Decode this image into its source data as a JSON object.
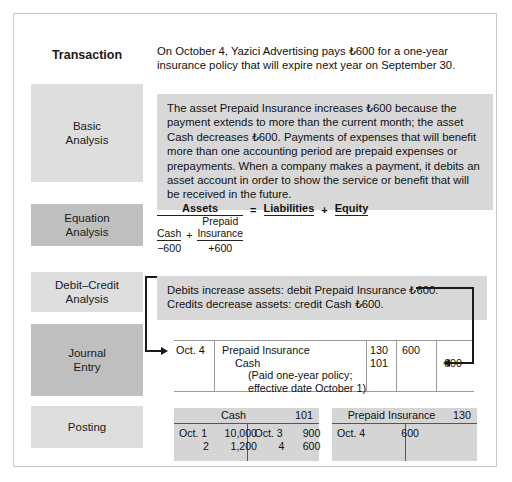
{
  "figure": {
    "currency_symbol": "₺",
    "border_color": "#c9c9c9",
    "shade_content": "#d8d8d8",
    "shade_label_dark": "#bfbfbf",
    "shade_label_light": "#dedede"
  },
  "stages": {
    "transaction": "Transaction",
    "basic_analysis": "Basic\nAnalysis",
    "basic_analysis_line1": "Basic",
    "basic_analysis_line2": "Analysis",
    "equation_analysis_line1": "Equation",
    "equation_analysis_line2": "Analysis",
    "debit_credit_line1": "Debit–Credit",
    "debit_credit_line2": "Analysis",
    "journal_entry_line1": "Journal",
    "journal_entry_line2": "Entry",
    "posting": "Posting"
  },
  "transaction": {
    "text": "On October 4, Yazici Advertising pays ₺600 for a one-year insurance policy that will expire next year on September 30."
  },
  "basic_analysis": {
    "text": "The asset Prepaid Insurance increases ₺600 because the payment extends to more than the current month; the asset Cash decreases ₺600. Payments of expenses that will benefit more than one accounting period are prepaid expenses or prepayments. When a company makes a payment, it debits an asset account in order to show the service or benefit that will be received in the future."
  },
  "equation_analysis": {
    "assets_header": "Assets",
    "equals": "=",
    "liabilities_header": "Liabilities",
    "plus_outer": "+",
    "equity_header": "Equity",
    "cash_label": "Cash",
    "plus_inner": "+",
    "prepaid_label_line1": "Prepaid",
    "prepaid_label_line2": "Insurance",
    "cash_value": "−600",
    "prepaid_value": "+600"
  },
  "debit_credit_analysis": {
    "line1": "Debits increase assets: debit Prepaid Insurance ₺600.",
    "line2": "Credits decrease assets: credit Cash ₺600."
  },
  "journal_entry": {
    "date": "Oct. 4",
    "account_debit": "Prepaid Insurance",
    "account_credit": "Cash",
    "memo_line1": "(Paid one-year policy;",
    "memo_line2": "effective date October 1)",
    "ref_debit": "130",
    "ref_credit": "101",
    "amount_debit": "600",
    "amount_credit": "600"
  },
  "posting": {
    "cash_account": {
      "title": "Cash",
      "number": "101",
      "debits": [
        {
          "date": "Oct. 1",
          "amount": "10,000"
        },
        {
          "date": "2",
          "amount": "1,200"
        }
      ],
      "credits": [
        {
          "date": "Oct. 3",
          "amount": "900"
        },
        {
          "date": "4",
          "amount": "600"
        }
      ]
    },
    "prepaid_account": {
      "title": "Prepaid Insurance",
      "number": "130",
      "debits": [
        {
          "date": "Oct. 4",
          "amount": "600"
        }
      ],
      "credits": []
    }
  }
}
